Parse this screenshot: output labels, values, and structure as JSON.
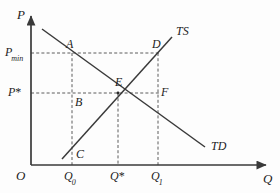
{
  "figure": {
    "kind": "supply-demand-price-floor-diagram",
    "background_color": "#fdfdfd",
    "line_color": "#3a3a3a",
    "text_color": "#1d1d1d"
  },
  "axes": {
    "y_label": "P",
    "x_label": "Q",
    "origin_label": "O",
    "x_axis": {
      "x1": 31,
      "y1": 165,
      "x2": 268,
      "y2": 165
    },
    "y_axis": {
      "x1": 31,
      "y1": 165,
      "x2": 31,
      "y2": 14
    }
  },
  "ticks": {
    "y": [
      {
        "id": "p-min",
        "label": "P",
        "subscript": "min",
        "value_y": 53
      },
      {
        "id": "p-star",
        "label": "P",
        "star": "*",
        "value_y": 93
      }
    ],
    "x": [
      {
        "id": "q-zero",
        "label": "Q",
        "subscript": "0",
        "value_x": 72
      },
      {
        "id": "q-star",
        "label": "Q",
        "star": "*",
        "value_x": 118
      },
      {
        "id": "q-one",
        "label": "Q",
        "subscript": "1",
        "value_x": 158
      }
    ]
  },
  "curves": [
    {
      "id": "supply",
      "label": "TS",
      "label_x": 176,
      "label_y": 25,
      "x1": 62,
      "y1": 159,
      "x2": 172,
      "y2": 37
    },
    {
      "id": "demand",
      "label": "TD",
      "label_x": 211,
      "label_y": 140,
      "x1": 42,
      "y1": 29,
      "x2": 205,
      "y2": 147
    }
  ],
  "points": [
    {
      "id": "A",
      "label": "A",
      "x": 72,
      "y": 53,
      "label_x": 66,
      "label_y": 38
    },
    {
      "id": "B",
      "label": "B",
      "x": 72,
      "y": 93,
      "label_x": 75,
      "label_y": 96
    },
    {
      "id": "C",
      "label": "C",
      "x": 72,
      "y": 150,
      "label_x": 76,
      "label_y": 148
    },
    {
      "id": "D",
      "label": "D",
      "x": 158,
      "y": 53,
      "label_x": 152,
      "label_y": 38
    },
    {
      "id": "E",
      "label": "E",
      "x": 118,
      "y": 93,
      "label_x": 115,
      "label_y": 76
    },
    {
      "id": "F",
      "label": "F",
      "x": 158,
      "y": 93,
      "label_x": 161,
      "label_y": 86
    }
  ],
  "guides": [
    {
      "id": "pmin-horizontal",
      "x1": 31,
      "y1": 53,
      "x2": 160,
      "y2": 53
    },
    {
      "id": "pstar-horizontal",
      "x1": 31,
      "y1": 93,
      "x2": 160,
      "y2": 93
    },
    {
      "id": "q0-vertical",
      "x1": 72,
      "y1": 53,
      "x2": 72,
      "y2": 165
    },
    {
      "id": "qstar-vertical",
      "x1": 118,
      "y1": 93,
      "x2": 118,
      "y2": 165
    },
    {
      "id": "q1-vertical",
      "x1": 158,
      "y1": 53,
      "x2": 158,
      "y2": 165
    }
  ]
}
